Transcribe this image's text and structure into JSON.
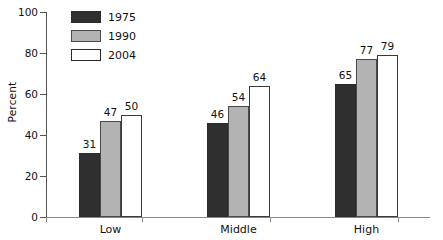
{
  "chart_data": {
    "type": "bar",
    "title": "",
    "xlabel": "",
    "ylabel": "Percent",
    "categories": [
      "Low",
      "Middle",
      "High"
    ],
    "series": [
      {
        "name": "1975",
        "color": "#2f2f2f",
        "values": [
          31,
          46,
          65
        ]
      },
      {
        "name": "1990",
        "color": "#b3b3b3",
        "values": [
          47,
          54,
          77
        ]
      },
      {
        "name": "2004",
        "color": "#ffffff",
        "values": [
          50,
          64,
          79
        ]
      }
    ],
    "ylim": [
      0,
      100
    ],
    "yticks": [
      0,
      20,
      40,
      60,
      80,
      100
    ],
    "ytick_labels": [
      "0",
      "20",
      "40",
      "60",
      "80",
      "100"
    ],
    "grid": false,
    "legend_position": "top-left-inside",
    "data_labels": true
  },
  "legend": {
    "items": [
      {
        "label": "1975",
        "swatch": "dark-swatch"
      },
      {
        "label": "1990",
        "swatch": "gray-swatch"
      },
      {
        "label": "2004",
        "swatch": "white-swatch"
      }
    ]
  },
  "axes": {
    "y_label": "Percent"
  }
}
